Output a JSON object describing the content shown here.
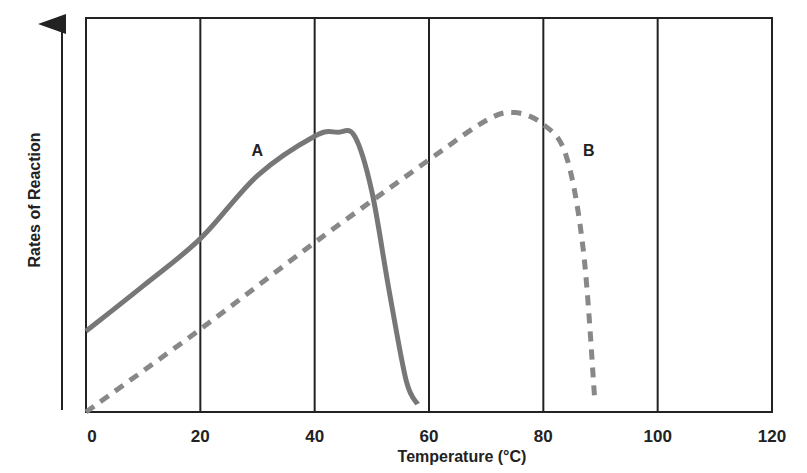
{
  "chart_data": {
    "type": "line",
    "title": "",
    "xlabel": "Temperature (°C)",
    "ylabel": "Rates of Reaction",
    "xlim": [
      0,
      120
    ],
    "ylim": [
      0,
      100
    ],
    "x_ticks": [
      "0",
      "20",
      "40",
      "60",
      "80",
      "100",
      "120"
    ],
    "y_ticks": [],
    "grid": "vertical lines at every x tick",
    "legend": "none (inline curve labels)",
    "series": [
      {
        "name": "A",
        "style": "solid",
        "color": "#777777",
        "points": [
          [
            0,
            20.5
          ],
          [
            10,
            32
          ],
          [
            20,
            44
          ],
          [
            30,
            60
          ],
          [
            40,
            70
          ],
          [
            44,
            71
          ],
          [
            47,
            70
          ],
          [
            50,
            56
          ],
          [
            53,
            31
          ],
          [
            56,
            8
          ],
          [
            58,
            2
          ]
        ]
      },
      {
        "name": "B",
        "style": "dashed",
        "color": "#888888",
        "points": [
          [
            0,
            0
          ],
          [
            20,
            21
          ],
          [
            40,
            43
          ],
          [
            60,
            64
          ],
          [
            70,
            74
          ],
          [
            75,
            76
          ],
          [
            80,
            73
          ],
          [
            84,
            65
          ],
          [
            87,
            41
          ],
          [
            89,
            3
          ]
        ]
      }
    ],
    "annotations": [
      {
        "text": "A",
        "x": 30,
        "y": 66
      },
      {
        "text": "B",
        "x": 88,
        "y": 66
      }
    ]
  }
}
